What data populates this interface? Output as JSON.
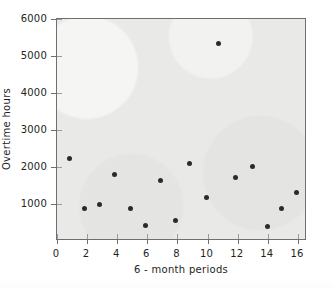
{
  "chart_data": {
    "type": "scatter",
    "title": "",
    "xlabel": "6 - month periods",
    "ylabel": "Overtime hours",
    "xlim": [
      0,
      16.6
    ],
    "ylim": [
      0,
      6000
    ],
    "xticks": [
      0,
      2,
      4,
      6,
      8,
      10,
      12,
      14,
      16
    ],
    "xtick_labels": [
      "0",
      "2",
      "4",
      "6",
      "8",
      "10",
      "12",
      "14",
      "16"
    ],
    "yticks": [
      1000,
      2000,
      3000,
      4000,
      5000,
      6000
    ],
    "ytick_labels": [
      "1000",
      "2000",
      "3000",
      "4000",
      "5000",
      "6000"
    ],
    "grid": false,
    "legend": null,
    "marker": "filled-circle",
    "marker_color": "#2b2b2b",
    "plot_background": "#e9e9e7",
    "axis_color": "#6f6f6f",
    "series": [
      {
        "name": "Overtime hours",
        "x": [
          0.8,
          1.8,
          2.8,
          3.85,
          4.9,
          5.9,
          6.9,
          7.9,
          8.8,
          9.9,
          10.7,
          11.85,
          12.95,
          14.0,
          14.9,
          15.9
        ],
        "y": [
          2240,
          880,
          980,
          1790,
          880,
          430,
          1640,
          560,
          2090,
          1180,
          5340,
          1720,
          2020,
          400,
          880,
          1300
        ]
      }
    ]
  },
  "axes": {
    "y_title": "Overtime hours",
    "x_title": "6 - month periods"
  }
}
